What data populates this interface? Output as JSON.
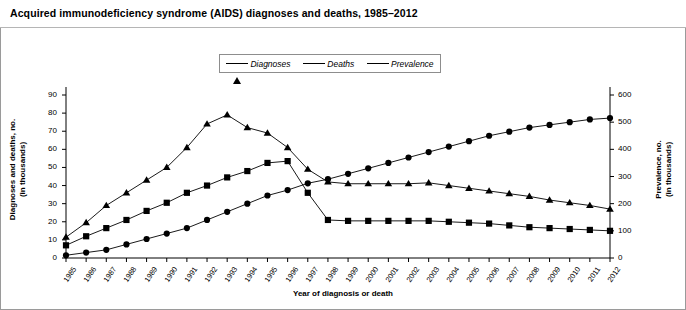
{
  "title": "Acquired immunodeficiency syndrome (AIDS) diagnoses and deaths, 1985–2012",
  "legend": {
    "position": "top-center",
    "items": [
      {
        "label": "Diagnoses",
        "marker": "triangle-marker",
        "color": "#000000"
      },
      {
        "label": "Deaths",
        "marker": "square-marker",
        "color": "#000000"
      },
      {
        "label": "Prevalence",
        "marker": "circle-marker",
        "color": "#000000"
      }
    ]
  },
  "axes": {
    "x_title": "Year of diagnosis or death",
    "y_left_title": "Diagnoses and deaths, no.\n(in thousands)",
    "y_left_title_line1": "Diagnoses and deaths, no.",
    "y_left_title_line2": "(in thousands)",
    "y_right_title_line1": "Prevalence, no.",
    "y_right_title_line2": "(in thousands)",
    "y_left_ticks": [
      "0",
      "10",
      "20",
      "30",
      "40",
      "50",
      "60",
      "70",
      "80",
      "90"
    ],
    "y_right_ticks": [
      "0",
      "100",
      "200",
      "300",
      "400",
      "500",
      "600"
    ]
  },
  "chart_data": {
    "type": "line",
    "title": "Acquired immunodeficiency syndrome (AIDS) diagnoses and deaths, 1985–2012",
    "xlabel": "Year of diagnosis or death",
    "ylabel": "Diagnoses and deaths, no. (in thousands)",
    "y2label": "Prevalence, no. (in thousands)",
    "ylim": [
      0,
      90
    ],
    "y2lim": [
      0,
      600
    ],
    "ytick_step": 10,
    "y2tick_step": 100,
    "grid": false,
    "legend_position": "top-center",
    "categories": [
      "1985",
      "1986",
      "1987",
      "1988",
      "1989",
      "1990",
      "1991",
      "1992",
      "1993",
      "1994",
      "1995",
      "1996",
      "1997",
      "1998",
      "1999",
      "2000",
      "2001",
      "2002",
      "2003",
      "2004",
      "2005",
      "2006",
      "2007",
      "2008",
      "2009",
      "2010",
      "2011",
      "2012"
    ],
    "series": [
      {
        "name": "Diagnoses",
        "marker": "triangle",
        "axis": "left",
        "units": "thousands",
        "values": [
          11.5,
          19.5,
          29,
          36,
          43,
          50,
          61,
          74,
          79,
          72,
          69,
          61,
          49,
          42,
          41,
          41,
          41,
          41,
          41.5,
          40,
          38.5,
          37,
          35.5,
          34,
          32,
          30.5,
          29,
          27
        ]
      },
      {
        "name": "Deaths",
        "marker": "square",
        "axis": "left",
        "units": "thousands",
        "values": [
          7,
          12,
          16.5,
          21,
          26,
          30.5,
          36,
          40,
          44.5,
          48,
          52.5,
          53.5,
          36,
          21,
          20.5,
          20.5,
          20.5,
          20.5,
          20.5,
          20,
          19.5,
          19,
          18,
          17,
          16.5,
          16,
          15.5,
          15
        ]
      },
      {
        "name": "Prevalence",
        "marker": "circle",
        "axis": "right",
        "units": "thousands",
        "values": [
          10,
          20,
          30,
          50,
          70,
          90,
          110,
          140,
          170,
          200,
          230,
          250,
          275,
          290,
          310,
          330,
          350,
          370,
          390,
          410,
          430,
          450,
          465,
          480,
          490,
          500,
          510,
          515
        ]
      }
    ]
  }
}
